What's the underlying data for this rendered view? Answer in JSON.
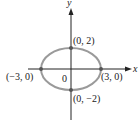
{
  "diagram": {
    "type": "ellipse-graph",
    "equation_semiaxes": {
      "a": 3,
      "b": 2
    },
    "axes": {
      "x_label": "x",
      "y_label": "y",
      "origin_label": "0"
    },
    "points": [
      {
        "label": "(0, 2)",
        "x": 0,
        "y": 2
      },
      {
        "label": "(−3, 0)",
        "x": -3,
        "y": 0
      },
      {
        "label": "(3, 0)",
        "x": 3,
        "y": 0
      },
      {
        "label": "(0, −2)",
        "x": 0,
        "y": -2
      }
    ],
    "colors": {
      "ellipse": "#9a9a9a",
      "axis": "#222222",
      "point": "#555555"
    }
  }
}
